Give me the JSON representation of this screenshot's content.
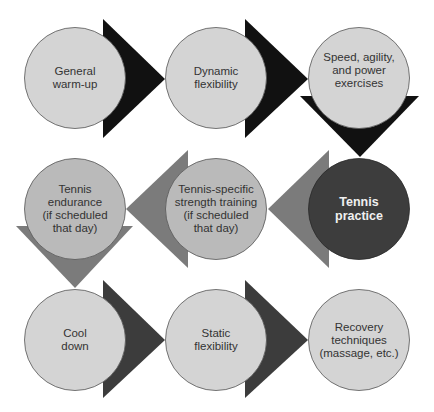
{
  "diagram": {
    "type": "process-flow",
    "colors": {
      "background": "#ffffff",
      "circle_light": "#d4d4d4",
      "circle_mid": "#bababa",
      "circle_dark": "#3d3d3d",
      "arrow_black": "#111111",
      "arrow_gray": "#7b7b7b",
      "arrow_dark": "#3c3c3c",
      "outline": "#555555"
    },
    "steps": [
      {
        "id": 1,
        "lines": [
          "General",
          "warm-up"
        ]
      },
      {
        "id": 2,
        "lines": [
          "Dynamic",
          "flexibility"
        ]
      },
      {
        "id": 3,
        "lines": [
          "Speed, agility,",
          "and power",
          "exercises"
        ]
      },
      {
        "id": 4,
        "lines": [
          "Tennis",
          "practice"
        ]
      },
      {
        "id": 5,
        "lines": [
          "Tennis-specific",
          "strength training",
          "(if scheduled",
          "that day)"
        ]
      },
      {
        "id": 6,
        "lines": [
          "Tennis",
          "endurance",
          "(if scheduled",
          "that day)"
        ]
      },
      {
        "id": 7,
        "lines": [
          "Cool",
          "down"
        ]
      },
      {
        "id": 8,
        "lines": [
          "Static",
          "flexibility"
        ]
      },
      {
        "id": 9,
        "lines": [
          "Recovery",
          "techniques",
          "(massage, etc.)"
        ]
      }
    ],
    "flow": [
      "1→2",
      "2→3",
      "3↓4",
      "4←5",
      "5←6",
      "6↓7",
      "7→8",
      "8→9"
    ]
  }
}
